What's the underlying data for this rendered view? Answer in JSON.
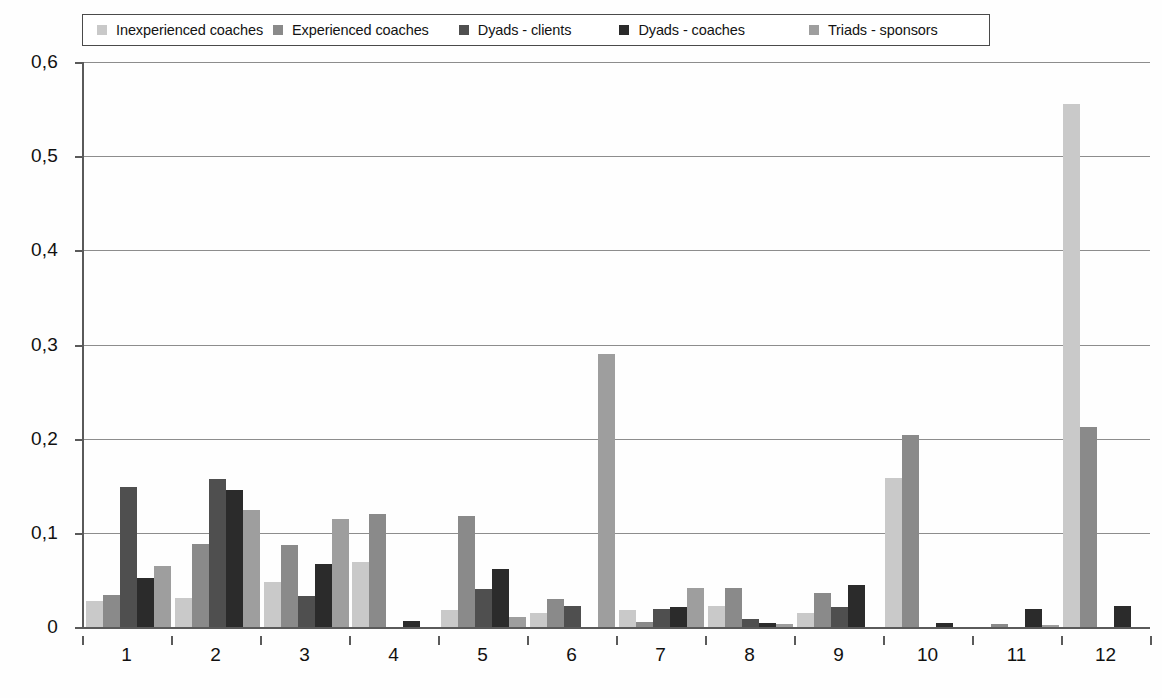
{
  "chart_data": {
    "type": "bar",
    "title": "",
    "xlabel": "",
    "ylabel": "",
    "ylim": [
      0,
      0.6
    ],
    "ytick_labels": [
      "0,6",
      "0,5",
      "0,4",
      "0,3",
      "0,2",
      "0,1",
      "0"
    ],
    "ytick_values": [
      0.6,
      0.5,
      0.4,
      0.3,
      0.2,
      0.1,
      0
    ],
    "grid": true,
    "legend_position": "top",
    "categories": [
      "1",
      "2",
      "3",
      "4",
      "5",
      "6",
      "7",
      "8",
      "9",
      "10",
      "11",
      "12"
    ],
    "series": [
      {
        "name": "Inexperienced coaches",
        "color": "#c9c9c9",
        "values": [
          0.028,
          0.031,
          0.048,
          0.069,
          0.018,
          0.015,
          0.018,
          0.022,
          0.015,
          0.158,
          0.0,
          0.555
        ]
      },
      {
        "name": "Experienced coaches",
        "color": "#8a8a8a",
        "values": [
          0.034,
          0.088,
          0.087,
          0.12,
          0.118,
          0.03,
          0.005,
          0.041,
          0.036,
          0.204,
          0.003,
          0.212
        ]
      },
      {
        "name": "Dyads - clients",
        "color": "#4f4f4f",
        "values": [
          0.149,
          0.157,
          0.033,
          0.0,
          0.04,
          0.022,
          0.019,
          0.009,
          0.021,
          0.0,
          0.0,
          0.0
        ]
      },
      {
        "name": "Dyads - coaches",
        "color": "#2b2b2b",
        "values": [
          0.052,
          0.145,
          0.067,
          0.006,
          0.062,
          0.0,
          0.021,
          0.004,
          0.045,
          0.004,
          0.019,
          0.022
        ]
      },
      {
        "name": "Triads - sponsors",
        "color": "#9e9e9e",
        "values": [
          0.065,
          0.124,
          0.115,
          0.0,
          0.011,
          0.29,
          0.041,
          0.003,
          0.0,
          0.0,
          0.002,
          0.0
        ]
      }
    ]
  },
  "legend": {
    "items": [
      {
        "label": "Inexperienced coaches",
        "color": "#c9c9c9"
      },
      {
        "label": "Experienced coaches",
        "color": "#8a8a8a"
      },
      {
        "label": "Dyads - clients",
        "color": "#4f4f4f"
      },
      {
        "label": "Dyads - coaches",
        "color": "#2b2b2b"
      },
      {
        "label": "Triads - sponsors",
        "color": "#9e9e9e"
      }
    ]
  }
}
